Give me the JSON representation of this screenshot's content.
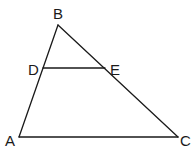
{
  "diagram": {
    "type": "triangle-with-midsegment",
    "points": {
      "A": {
        "label": "A",
        "x": 19,
        "y": 137,
        "lx": 5,
        "ly": 146
      },
      "B": {
        "label": "B",
        "x": 58,
        "y": 25,
        "lx": 53,
        "ly": 19
      },
      "C": {
        "label": "C",
        "x": 178,
        "y": 137,
        "lx": 180,
        "ly": 146
      },
      "D": {
        "label": "D",
        "x": 43,
        "y": 68,
        "lx": 28,
        "ly": 75
      },
      "E": {
        "label": "E",
        "x": 105,
        "y": 68,
        "lx": 110,
        "ly": 75
      }
    },
    "segments": [
      [
        "A",
        "B"
      ],
      [
        "B",
        "C"
      ],
      [
        "A",
        "C"
      ],
      [
        "D",
        "E"
      ]
    ],
    "stroke_color": "#1a1a1a",
    "background": "#ffffff"
  }
}
